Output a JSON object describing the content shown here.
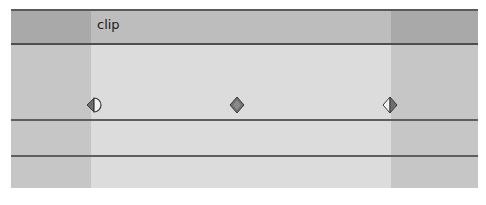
{
  "track": {
    "clip_label": "clip",
    "keyframes": [
      {
        "type": "ease-in-half",
        "x": 94
      },
      {
        "type": "linear",
        "x": 237
      },
      {
        "type": "ease-out-half",
        "x": 390
      }
    ]
  },
  "colors": {
    "header_dark": "#a9a9a9",
    "header_clip": "#bdbdbd",
    "body_outside": "#c6c6c6",
    "body_clip": "#dcdcdc",
    "line": "#5e5e5e",
    "keyframe_dark": "#6e6e6e"
  }
}
